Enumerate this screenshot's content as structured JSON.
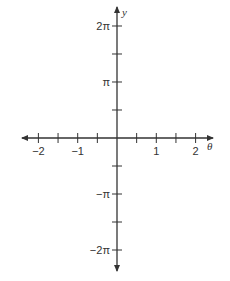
{
  "chart_data": {
    "type": "line",
    "title": "",
    "xlabel": "θ",
    "ylabel": "y",
    "x_ticks": [
      {
        "value": -2,
        "label": "−2"
      },
      {
        "value": -1.5,
        "label": ""
      },
      {
        "value": -1,
        "label": "−1"
      },
      {
        "value": -0.5,
        "label": ""
      },
      {
        "value": 0.5,
        "label": ""
      },
      {
        "value": 1,
        "label": "1"
      },
      {
        "value": 1.5,
        "label": ""
      },
      {
        "value": 2,
        "label": "2"
      }
    ],
    "y_ticks": [
      {
        "value": "2π",
        "numeric": 6.2832,
        "label": "2π"
      },
      {
        "value": "3π/2",
        "numeric": 4.7124,
        "label": ""
      },
      {
        "value": "π",
        "numeric": 3.1416,
        "label": "π"
      },
      {
        "value": "π/2",
        "numeric": 1.5708,
        "label": ""
      },
      {
        "value": "-π/2",
        "numeric": -1.5708,
        "label": ""
      },
      {
        "value": "-π",
        "numeric": -3.1416,
        "label": "−π"
      },
      {
        "value": "-3π/2",
        "numeric": -4.7124,
        "label": ""
      },
      {
        "value": "-2π",
        "numeric": -6.2832,
        "label": "−2π"
      }
    ],
    "xlim": [
      -2.5,
      2.5
    ],
    "ylim": [
      -7.0,
      7.0
    ],
    "series": [],
    "grid": false,
    "legend": null,
    "axis_color": "#333333"
  }
}
